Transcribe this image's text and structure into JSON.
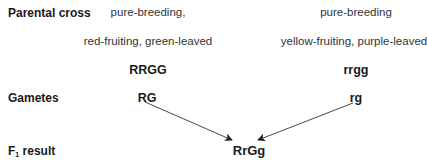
{
  "labels": {
    "parental_cross": "Parental cross",
    "gametes": "Gametes",
    "f1_prefix": "F",
    "f1_sub": "1",
    "f1_suffix": " result"
  },
  "left_parent": {
    "line1": "pure-breeding,",
    "line2": "red-fruiting, green-leaved",
    "genotype": "RRGG",
    "gamete": "RG"
  },
  "right_parent": {
    "line1": "pure-breeding",
    "line2": "yellow-fruiting, purple-leaved",
    "genotype": "rrgg",
    "gamete": "rg"
  },
  "f1": {
    "genotype": "RrGg"
  },
  "arrows": [
    {
      "from": "RG",
      "to": "RrGg"
    },
    {
      "from": "rg",
      "to": "RrGg"
    }
  ]
}
